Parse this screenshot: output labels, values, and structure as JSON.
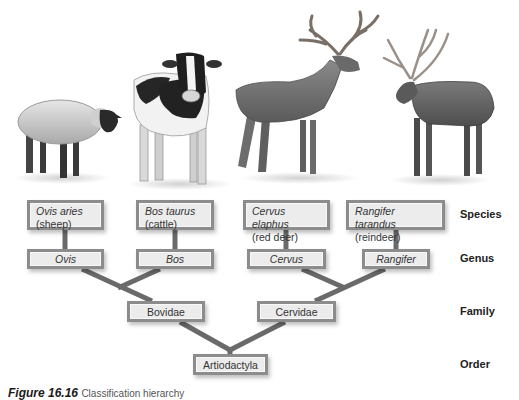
{
  "diagram": {
    "title": "Classification hierarchy",
    "animals": [
      {
        "name": "sheep",
        "icon": "sheep-illustration"
      },
      {
        "name": "cattle",
        "icon": "cow-illustration"
      },
      {
        "name": "red deer",
        "icon": "red-deer-illustration"
      },
      {
        "name": "reindeer",
        "icon": "reindeer-illustration"
      }
    ],
    "species": [
      {
        "scientific": "Ovis aries",
        "common": "(sheep)"
      },
      {
        "scientific": "Bos taurus",
        "common": "(cattle)"
      },
      {
        "scientific": "Cervus elaphus",
        "common": "(red deer)"
      },
      {
        "scientific": "Rangifer tarandus",
        "common": "(reindeer)"
      }
    ],
    "genus": [
      "Ovis",
      "Bos",
      "Cervus",
      "Rangifer"
    ],
    "family": [
      "Bovidae",
      "Cervidae"
    ],
    "order": [
      "Artiodactyla"
    ],
    "ranks": {
      "species": "Species",
      "genus": "Genus",
      "family": "Family",
      "order": "Order"
    },
    "colors": {
      "box_fill": "#ececec",
      "box_border": "#8c8c8c",
      "connector": "#6a6a6a"
    }
  },
  "caption": {
    "label": "Figure 16.16",
    "text": "Classification hierarchy"
  }
}
